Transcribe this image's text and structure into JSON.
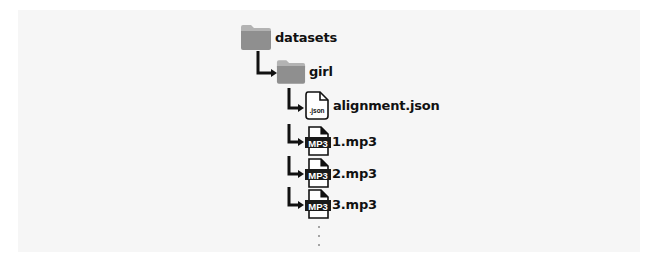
{
  "tree": {
    "root": {
      "label": "datasets",
      "icon": "folder-icon"
    },
    "child": {
      "label": "girl",
      "icon": "folder-icon"
    },
    "files": [
      {
        "label": "alignment.json",
        "icon": "json-file-icon",
        "badge": ".json"
      },
      {
        "label": "1.mp3",
        "icon": "mp3-file-icon",
        "badge": "MP3"
      },
      {
        "label": "2.mp3",
        "icon": "mp3-file-icon",
        "badge": "MP3"
      },
      {
        "label": "3.mp3",
        "icon": "mp3-file-icon",
        "badge": "MP3"
      }
    ],
    "more_indicator": "⋮"
  },
  "colors": {
    "folder": "#8f8f8f",
    "folder_tab": "#a8a8a8",
    "line": "#111111",
    "panel": "#f6f6f6"
  }
}
